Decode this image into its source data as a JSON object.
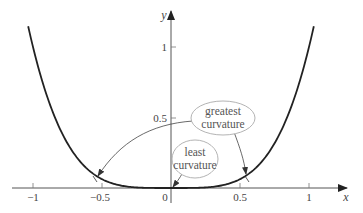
{
  "chart_data": {
    "type": "line",
    "title": "",
    "function": "y = x^4",
    "xlabel": "x",
    "ylabel": "y",
    "xlim": [
      -1.1,
      1.35
    ],
    "ylim": [
      -0.1,
      1.3
    ],
    "grid": false,
    "legend": null,
    "x_ticks": [
      -1,
      -0.5,
      0,
      0.5,
      1
    ],
    "x_tick_labels": [
      "−1",
      "−0.5",
      "0",
      "0.5",
      "1"
    ],
    "y_ticks": [
      0.5,
      1
    ],
    "y_tick_labels": [
      "0.5",
      "1"
    ],
    "series": [
      {
        "name": "y = x^4",
        "x": [
          -1.04,
          -1.0,
          -0.9,
          -0.8,
          -0.7,
          -0.6,
          -0.5,
          -0.4,
          -0.3,
          -0.2,
          -0.1,
          0,
          0.1,
          0.2,
          0.3,
          0.4,
          0.5,
          0.6,
          0.7,
          0.8,
          0.9,
          1.0,
          1.04
        ],
        "y": [
          1.17,
          1.0,
          0.656,
          0.41,
          0.24,
          0.13,
          0.0625,
          0.0256,
          0.0081,
          0.0016,
          0.0001,
          0,
          0.0001,
          0.0016,
          0.0081,
          0.0256,
          0.0625,
          0.13,
          0.24,
          0.41,
          0.656,
          1.0,
          1.17
        ]
      }
    ],
    "annotations": [
      {
        "text_lines": [
          "greatest",
          "curvature"
        ],
        "points_to": [
          [
            -0.54,
            0.085
          ],
          [
            0.54,
            0.085
          ]
        ]
      },
      {
        "text_lines": [
          "least",
          "curvature"
        ],
        "points_to": [
          [
            0,
            0
          ]
        ]
      }
    ]
  },
  "axes": {
    "x_name": "x",
    "y_name": "y",
    "x_tick_labels": [
      "−1",
      "−0.5",
      "0",
      "0.5",
      "1"
    ],
    "y_tick_labels": [
      "0.5",
      "1"
    ]
  },
  "callouts": {
    "greatest": {
      "line1": "greatest",
      "line2": "curvature"
    },
    "least": {
      "line1": "least",
      "line2": "curvature"
    }
  }
}
